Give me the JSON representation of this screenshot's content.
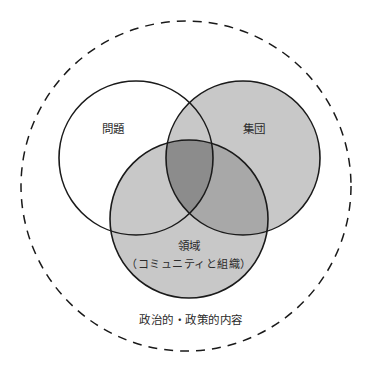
{
  "diagram": {
    "type": "venn-3-circle-with-context-boundary",
    "canvas": {
      "width": 385,
      "height": 371,
      "background": "#ffffff"
    },
    "colors": {
      "stroke": "#1a1a1a",
      "text": "#2b2b2b",
      "fill_none": "#ffffff",
      "fill_light": "#c8c8c8",
      "fill_medium": "#b4b4b4",
      "fill_dark": "#8c8c8c",
      "dashed_stroke": "#1a1a1a"
    },
    "outer_boundary": {
      "name": "political-policy-context",
      "style": "dashed",
      "label": "政治的・政策的内容",
      "cx": 186,
      "cy": 186,
      "r": 165
    },
    "circles": [
      {
        "id": "problem",
        "label": "問題",
        "cx": 136,
        "cy": 158,
        "r": 77,
        "fill": "none",
        "label_x": 113,
        "label_y": 129
      },
      {
        "id": "group",
        "label": "集団",
        "cx": 243,
        "cy": 158,
        "r": 77,
        "fill": "light",
        "label_x": 254,
        "label_y": 129
      },
      {
        "id": "domain",
        "label": "領域",
        "sublabel": "（コミュニティと組織）",
        "cx": 189,
        "cy": 219,
        "r": 79,
        "fill": "light",
        "label_x": 189,
        "label_y": 246,
        "sublabel_x": 189,
        "sublabel_y": 264
      }
    ],
    "outer_label_position": {
      "x": 191,
      "y": 320
    }
  }
}
